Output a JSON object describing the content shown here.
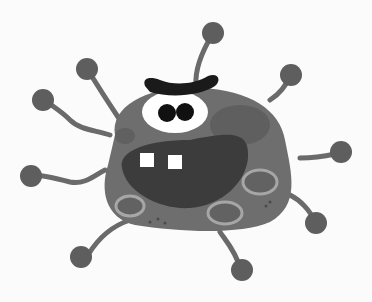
{
  "image": {
    "subject": "cartoon germ monster",
    "width": 372,
    "height": 302
  },
  "colors": {
    "background": "#fbfbfb",
    "body": "#6e6e6e",
    "body_dark": "#5a5a5a",
    "mouth": "#3a3a3a",
    "eyebrow": "#1a1a1a",
    "eye_white": "#ffffff",
    "pupil": "#111111",
    "teeth": "#ffffff",
    "spot_ring": "#a6a6a6",
    "spot_fill": "#626262",
    "tentacle": "#6a6a6a",
    "tentacle_ball": "#5e5e5e"
  }
}
